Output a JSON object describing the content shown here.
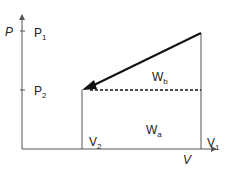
{
  "diagram": {
    "axes": {
      "y_label": "P",
      "x_label": "V"
    },
    "ticks": {
      "p1": {
        "main": "P",
        "sub": "1"
      },
      "p2": {
        "main": "P",
        "sub": "2"
      },
      "v1": {
        "main": "V",
        "sub": "1"
      },
      "v2": {
        "main": "V",
        "sub": "2"
      }
    },
    "regions": {
      "wa": {
        "main": "W",
        "sub": "a"
      },
      "wb": {
        "main": "W",
        "sub": "b"
      }
    },
    "colors": {
      "line": "#111111",
      "axis": "#555555"
    }
  }
}
